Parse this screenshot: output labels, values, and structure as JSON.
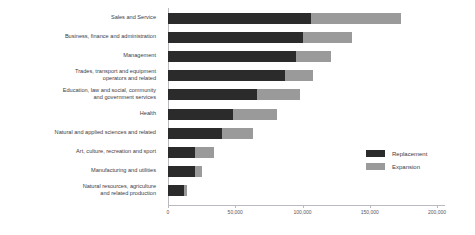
{
  "chart_data": {
    "type": "bar",
    "orientation": "horizontal",
    "stacked": true,
    "title": "",
    "subtitle": "",
    "xlabel": "",
    "ylabel": "",
    "xlim": [
      0,
      200000
    ],
    "grid": false,
    "legend_position": "right",
    "tick_labels": [
      "0",
      "50,000",
      "100,000",
      "150,000",
      "200,000"
    ],
    "tick_values": [
      0,
      50000,
      100000,
      150000,
      200000
    ],
    "categories": [
      "Sales and Service",
      "Business, finance and administration",
      "Management",
      "Trades, transport and equipment\noperators and related",
      "Education, law and social, community\nand government services",
      "Health",
      "Natural and applied sciences and related",
      "Art, culture, recreation and sport",
      "Manufacturing and utilities",
      "Natural resources, agriculture\nand related production"
    ],
    "series": [
      {
        "name": "Replacement",
        "color": "#2b2b2b",
        "values": [
          106000,
          100000,
          95000,
          87000,
          66000,
          48000,
          40000,
          20000,
          20000,
          12000
        ]
      },
      {
        "name": "Expansion",
        "color": "#9a9a9a",
        "values": [
          67000,
          37000,
          26000,
          21000,
          32000,
          33000,
          23000,
          14000,
          5000,
          2000
        ]
      }
    ]
  },
  "legend": {
    "items": [
      {
        "label": "Replacement",
        "color": "#2b2b2b"
      },
      {
        "label": "Expansion",
        "color": "#9a9a9a"
      }
    ]
  },
  "colors": {
    "replacement": "#2b2b2b",
    "expansion": "#9a9a9a",
    "axis": "#b9b9bf",
    "text": "#3b3b46",
    "background": "#ffffff"
  }
}
